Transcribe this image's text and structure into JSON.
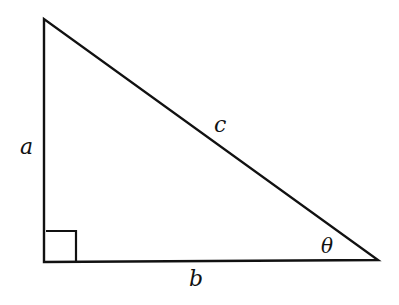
{
  "diagram": {
    "labels": {
      "a": "a",
      "b": "b",
      "c": "c",
      "theta": "θ"
    },
    "vertices": {
      "top": [
        44,
        19
      ],
      "right_angle": [
        44,
        262
      ],
      "angle_theta": [
        378,
        260
      ]
    },
    "stroke_color": "#111111"
  }
}
